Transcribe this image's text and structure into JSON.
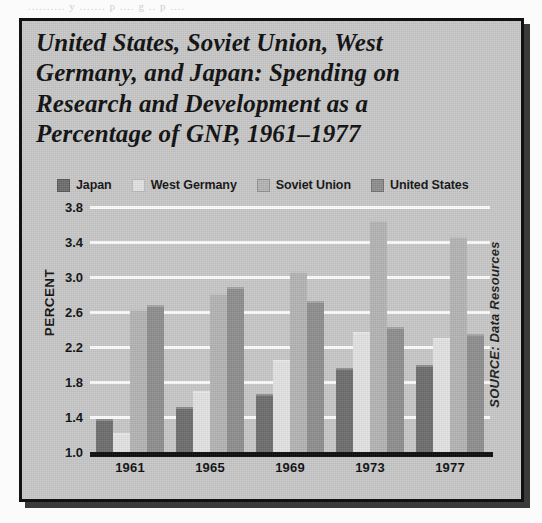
{
  "page": {
    "bleed_text": "..........   y ....... p .... g  .. p ...."
  },
  "figure": {
    "title": "United States, Soviet Union, West Germany, and Japan: Spending on Research and Development as a Percentage of GNP, 1961–1977",
    "title_lines": [
      "United States, Soviet Union, West",
      "Germany, and Japan: Spending on",
      "Research and Development as a",
      "Percentage of GNP, 1961–1977"
    ],
    "source": "SOURCE: Data Resources",
    "frame_color": "#111111",
    "background_color": "#c8c8c8"
  },
  "chart_data": {
    "type": "bar",
    "title": "United States, Soviet Union, West Germany, and Japan: Spending on Research and Development as a Percentage of GNP, 1961–1977",
    "xlabel": "",
    "ylabel": "PERCENT",
    "categories": [
      "1961",
      "1965",
      "1969",
      "1973",
      "1977"
    ],
    "series": [
      {
        "name": "Japan",
        "color": "#6d6d6d",
        "values": [
          1.38,
          1.52,
          1.66,
          1.96,
          1.99
        ]
      },
      {
        "name": "West Germany",
        "color": "#e3e3e3",
        "values": [
          1.22,
          1.7,
          2.05,
          2.37,
          2.3
        ]
      },
      {
        "name": "Soviet Union",
        "color": "#b4b4b4",
        "values": [
          2.63,
          2.82,
          3.07,
          3.65,
          3.47
        ]
      },
      {
        "name": "United States",
        "color": "#8e8e8e",
        "values": [
          2.68,
          2.89,
          2.73,
          2.43,
          2.35
        ]
      }
    ],
    "ylim": [
      1.0,
      3.8
    ],
    "yticks": [
      1.0,
      1.4,
      1.8,
      2.2,
      2.6,
      3.0,
      3.4,
      3.8
    ],
    "ytick_labels": [
      "1.0",
      "1.4",
      "1.8",
      "2.2",
      "2.6",
      "3.0",
      "3.4",
      "3.8"
    ],
    "grid": true,
    "grid_color": "#fdfdfd",
    "legend_position": "top",
    "source": "SOURCE: Data Resources"
  }
}
